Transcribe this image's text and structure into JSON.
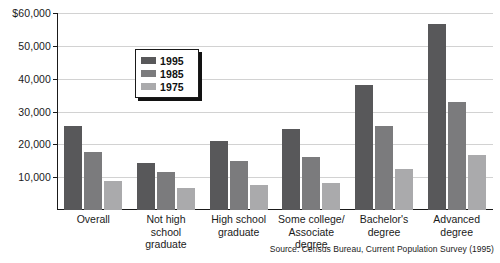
{
  "chart_data": {
    "type": "bar",
    "title": "",
    "xlabel": "",
    "ylabel": "",
    "ylim": [
      0,
      60000
    ],
    "grid": true,
    "legend_position": "inside-upper-left",
    "categories": [
      "Overall",
      "Not high school graduate",
      "High school graduate",
      "Some college/ Associate degree",
      "Bachelor's degree",
      "Advanced degree"
    ],
    "category_lines": [
      [
        "Overall"
      ],
      [
        "Not high",
        "school",
        "graduate"
      ],
      [
        "High school",
        "graduate"
      ],
      [
        "Some college/",
        "Associate",
        "degree"
      ],
      [
        "Bachelor's",
        "degree"
      ],
      [
        "Advanced",
        "degree"
      ]
    ],
    "series": [
      {
        "name": "1995",
        "color": "#58585a",
        "values": [
          25500,
          14200,
          21000,
          24800,
          38000,
          56800
        ]
      },
      {
        "name": "1985",
        "color": "#7b7b7d",
        "values": [
          17800,
          11500,
          14800,
          16100,
          25500,
          32800
        ]
      },
      {
        "name": "1975",
        "color": "#aaaaac",
        "values": [
          8700,
          6700,
          7700,
          8300,
          12500,
          16700
        ]
      }
    ],
    "y_ticks": [
      {
        "value": 60000,
        "label": "$60,000"
      },
      {
        "value": 50000,
        "label": "50,000"
      },
      {
        "value": 40000,
        "label": "40,000"
      },
      {
        "value": 30000,
        "label": "30,000"
      },
      {
        "value": 20000,
        "label": "20,000"
      },
      {
        "value": 10000,
        "label": "10,000"
      }
    ],
    "annotations": {
      "source": "Source: Census Bureau, Current Population Survey (1995)"
    }
  },
  "legend": {
    "items": [
      {
        "label": "1995",
        "series": "s1995"
      },
      {
        "label": "1985",
        "series": "s1985"
      },
      {
        "label": "1975",
        "series": "s1975"
      }
    ]
  },
  "source_note": "Source: Census Bureau, Current Population Survey (1995)"
}
